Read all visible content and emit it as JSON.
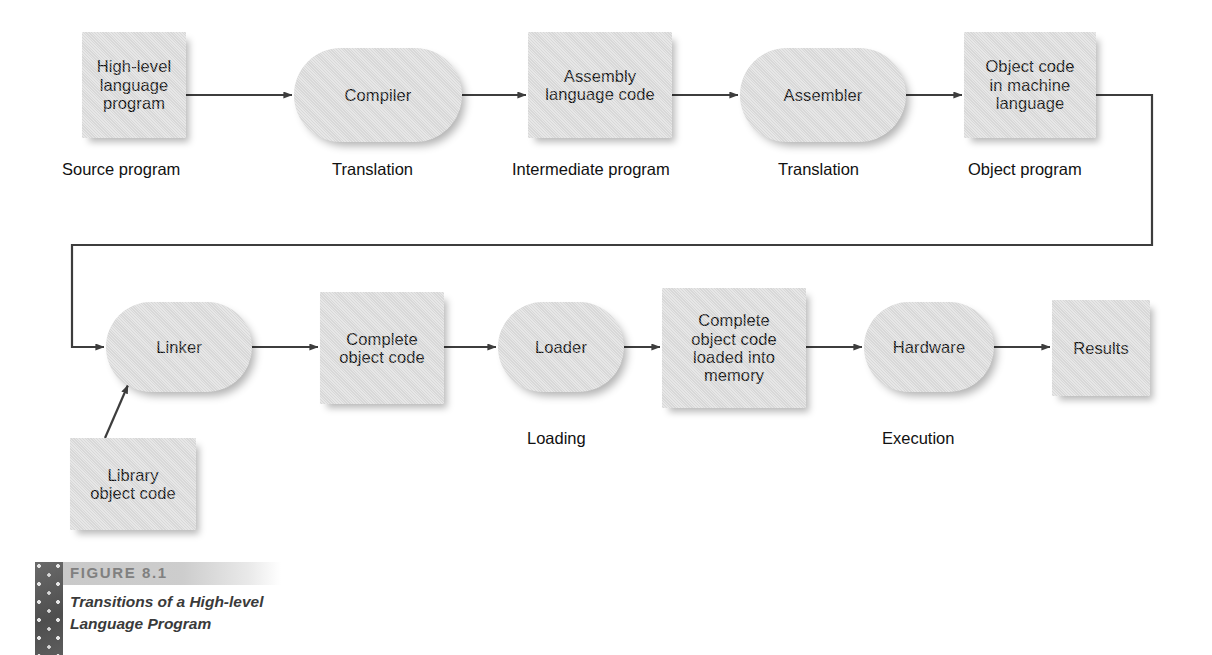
{
  "figure": {
    "number_label": "FIGURE 8.1",
    "caption": "Transitions of a High-level\nLanguage Program",
    "swatch_color": "#5b5b5b",
    "band_color": "#c9c9c9",
    "number_color": "#808080",
    "caption_color": "#3a3a3a"
  },
  "style": {
    "node_fill": "#dcdcdc",
    "node_text": "#111111",
    "connector_color": "#3d3d3d",
    "page_background": "#ffffff"
  },
  "nodes": {
    "source_program": {
      "label": "High-level\nlanguage\nprogram",
      "shape": "rect"
    },
    "compiler": {
      "label": "Compiler",
      "shape": "pill"
    },
    "assembly_code": {
      "label": "Assembly\nlanguage code",
      "shape": "rect"
    },
    "assembler": {
      "label": "Assembler",
      "shape": "pill"
    },
    "object_code": {
      "label": "Object code\nin machine\nlanguage",
      "shape": "rect"
    },
    "linker": {
      "label": "Linker",
      "shape": "pill"
    },
    "complete_object_code": {
      "label": "Complete\nobject code",
      "shape": "rect"
    },
    "loader": {
      "label": "Loader",
      "shape": "pill"
    },
    "loaded_memory": {
      "label": "Complete\nobject code\nloaded into\nmemory",
      "shape": "rect"
    },
    "hardware": {
      "label": "Hardware",
      "shape": "pill"
    },
    "results": {
      "label": "Results",
      "shape": "rect"
    },
    "library_object_code": {
      "label": "Library\nobject code",
      "shape": "rect"
    }
  },
  "stage_labels": {
    "source_program": "Source program",
    "translation_1": "Translation",
    "intermediate_program": "Intermediate program",
    "translation_2": "Translation",
    "object_program": "Object program",
    "loading": "Loading",
    "execution": "Execution"
  }
}
